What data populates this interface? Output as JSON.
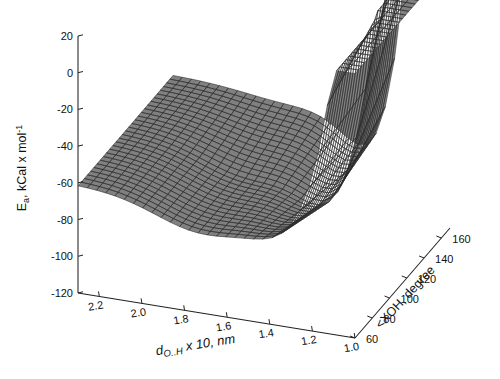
{
  "figure": {
    "kind": "3d-surface-mesh-plot",
    "background_color": "#ffffff",
    "surface_fill_color": "#808080",
    "surface_line_color": "#2b2b2b",
    "axis_color": "#222222"
  },
  "axes": {
    "z": {
      "label": "E",
      "label_sub": "a",
      "label_rest": ", kCal x mol",
      "label_sup": "-1",
      "full_label": "Ea, kCal x mol-1",
      "ticks": [
        "20",
        "0",
        "-20",
        "-40",
        "-60",
        "-80",
        "-100",
        "-120"
      ],
      "tick_values": [
        20,
        0,
        -20,
        -40,
        -60,
        -80,
        -100,
        -120
      ],
      "min": -120,
      "max": 20
    },
    "x": {
      "label_main": "d",
      "label_sub": "O..H",
      "label_rest": " x 10, nm",
      "full_label": "dO..H x 10, nm",
      "ticks": [
        "2.2",
        "2.0",
        "1.8",
        "1.6",
        "1.4",
        "1.2",
        "1.0"
      ],
      "tick_values": [
        2.2,
        2.0,
        1.8,
        1.6,
        1.4,
        1.2,
        1.0
      ],
      "min": 1.0,
      "max": 2.3
    },
    "y": {
      "label": "<XOH, degree",
      "ticks": [
        "60",
        "80",
        "100",
        "120",
        "140",
        "160"
      ],
      "tick_values": [
        60,
        80,
        100,
        120,
        140,
        160
      ],
      "min": 60,
      "max": 170
    }
  },
  "chart_data": {
    "type": "surface",
    "title": "",
    "xlabel": "dO..H x 10, nm",
    "ylabel": "<XOH, degree",
    "zlabel": "Ea, kCal x mol-1",
    "xlim": [
      1.0,
      2.3
    ],
    "ylim": [
      60,
      170
    ],
    "zlim": [
      -120,
      20
    ],
    "grid": false,
    "legend": "none",
    "z_extremes": {
      "max": 18,
      "min": -92,
      "plateau_far_field": -60
    },
    "surface_grid": {
      "nx": 31,
      "ny": 31,
      "x_start": 2.3,
      "x_end": 1.0,
      "y_start": 60,
      "y_end": 170
    },
    "model": {
      "form": "morse_plus_angular",
      "plateau": -60,
      "well_depth_extra": -32,
      "well_center_x": 1.3,
      "well_width_x": 0.22,
      "repulsive_amplitude": 115,
      "repulsive_onset_x": 1.12,
      "repulsive_width_x": 0.115,
      "angle_modulation_amplitude": 26,
      "angle_center": 115
    }
  },
  "projection": {
    "origin_px": [
      355,
      338
    ],
    "x_axis_end_px": [
      78,
      293
    ],
    "y_axis_end_px": [
      450,
      228
    ],
    "z_axis_top_px": [
      78,
      36
    ],
    "z_axis_bottom_px": [
      78,
      293
    ]
  }
}
